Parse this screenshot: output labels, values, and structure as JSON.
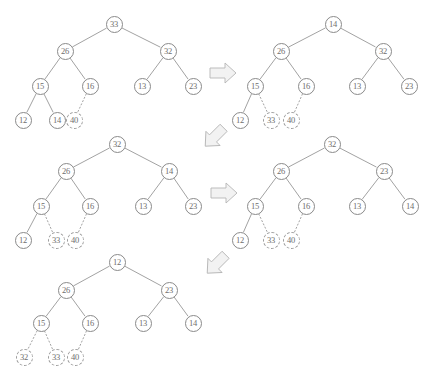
{
  "diagram": {
    "node_colors": {
      "stroke": "#8a8a8a",
      "dashed_stroke": "#9a9a9a",
      "text": "#6e6e6e",
      "edge": "#8a8a8a",
      "arrow_fill": "#f2f2f2",
      "arrow_stroke": "#b5b5b5"
    },
    "trees": [
      {
        "id": "tree-1",
        "nodes": [
          {
            "label": "33",
            "x": 114,
            "y": 24,
            "dashed": false
          },
          {
            "label": "26",
            "x": 65,
            "y": 51,
            "dashed": false
          },
          {
            "label": "32",
            "x": 168,
            "y": 51,
            "dashed": false
          },
          {
            "label": "15",
            "x": 40,
            "y": 86,
            "dashed": false
          },
          {
            "label": "16",
            "x": 90,
            "y": 86,
            "dashed": false
          },
          {
            "label": "13",
            "x": 142,
            "y": 86,
            "dashed": false
          },
          {
            "label": "23",
            "x": 193,
            "y": 86,
            "dashed": false
          },
          {
            "label": "12",
            "x": 23,
            "y": 120,
            "dashed": false
          },
          {
            "label": "14",
            "x": 57,
            "y": 120,
            "dashed": false
          },
          {
            "label": "40",
            "x": 74,
            "y": 120,
            "dashed": true
          }
        ],
        "edges": [
          {
            "from": 0,
            "to": 1,
            "dashed": false
          },
          {
            "from": 0,
            "to": 2,
            "dashed": false
          },
          {
            "from": 1,
            "to": 3,
            "dashed": false
          },
          {
            "from": 1,
            "to": 4,
            "dashed": false
          },
          {
            "from": 2,
            "to": 5,
            "dashed": false
          },
          {
            "from": 2,
            "to": 6,
            "dashed": false
          },
          {
            "from": 3,
            "to": 7,
            "dashed": false
          },
          {
            "from": 3,
            "to": 8,
            "dashed": false
          },
          {
            "from": 4,
            "to": 9,
            "dashed": true
          }
        ]
      },
      {
        "id": "tree-2",
        "nodes": [
          {
            "label": "14",
            "x": 333,
            "y": 24,
            "dashed": false
          },
          {
            "label": "26",
            "x": 281,
            "y": 51,
            "dashed": false
          },
          {
            "label": "32",
            "x": 383,
            "y": 51,
            "dashed": false
          },
          {
            "label": "15",
            "x": 255,
            "y": 86,
            "dashed": false
          },
          {
            "label": "16",
            "x": 306,
            "y": 86,
            "dashed": false
          },
          {
            "label": "13",
            "x": 357,
            "y": 86,
            "dashed": false
          },
          {
            "label": "23",
            "x": 409,
            "y": 86,
            "dashed": false
          },
          {
            "label": "12",
            "x": 240,
            "y": 120,
            "dashed": false
          },
          {
            "label": "33",
            "x": 271,
            "y": 120,
            "dashed": true
          },
          {
            "label": "40",
            "x": 291,
            "y": 120,
            "dashed": true
          }
        ],
        "edges": [
          {
            "from": 0,
            "to": 1,
            "dashed": false
          },
          {
            "from": 0,
            "to": 2,
            "dashed": false
          },
          {
            "from": 1,
            "to": 3,
            "dashed": false
          },
          {
            "from": 1,
            "to": 4,
            "dashed": false
          },
          {
            "from": 2,
            "to": 5,
            "dashed": false
          },
          {
            "from": 2,
            "to": 6,
            "dashed": false
          },
          {
            "from": 3,
            "to": 7,
            "dashed": false
          },
          {
            "from": 3,
            "to": 8,
            "dashed": true
          },
          {
            "from": 4,
            "to": 9,
            "dashed": true
          }
        ]
      },
      {
        "id": "tree-3",
        "nodes": [
          {
            "label": "32",
            "x": 117,
            "y": 144,
            "dashed": false
          },
          {
            "label": "26",
            "x": 66,
            "y": 171,
            "dashed": false
          },
          {
            "label": "14",
            "x": 169,
            "y": 171,
            "dashed": false
          },
          {
            "label": "15",
            "x": 41,
            "y": 206,
            "dashed": false
          },
          {
            "label": "16",
            "x": 90,
            "y": 206,
            "dashed": false
          },
          {
            "label": "13",
            "x": 143,
            "y": 206,
            "dashed": false
          },
          {
            "label": "23",
            "x": 193,
            "y": 206,
            "dashed": false
          },
          {
            "label": "12",
            "x": 23,
            "y": 240,
            "dashed": false
          },
          {
            "label": "33",
            "x": 56,
            "y": 240,
            "dashed": true
          },
          {
            "label": "40",
            "x": 75,
            "y": 240,
            "dashed": true
          }
        ],
        "edges": [
          {
            "from": 0,
            "to": 1,
            "dashed": false
          },
          {
            "from": 0,
            "to": 2,
            "dashed": false
          },
          {
            "from": 1,
            "to": 3,
            "dashed": false
          },
          {
            "from": 1,
            "to": 4,
            "dashed": false
          },
          {
            "from": 2,
            "to": 5,
            "dashed": false
          },
          {
            "from": 2,
            "to": 6,
            "dashed": false
          },
          {
            "from": 3,
            "to": 7,
            "dashed": false
          },
          {
            "from": 3,
            "to": 8,
            "dashed": true
          },
          {
            "from": 4,
            "to": 9,
            "dashed": true
          }
        ]
      },
      {
        "id": "tree-4",
        "nodes": [
          {
            "label": "32",
            "x": 332,
            "y": 144,
            "dashed": false
          },
          {
            "label": "26",
            "x": 281,
            "y": 171,
            "dashed": false
          },
          {
            "label": "23",
            "x": 384,
            "y": 171,
            "dashed": false
          },
          {
            "label": "15",
            "x": 255,
            "y": 206,
            "dashed": false
          },
          {
            "label": "16",
            "x": 306,
            "y": 206,
            "dashed": false
          },
          {
            "label": "13",
            "x": 357,
            "y": 206,
            "dashed": false
          },
          {
            "label": "14",
            "x": 410,
            "y": 206,
            "dashed": false
          },
          {
            "label": "12",
            "x": 240,
            "y": 240,
            "dashed": false
          },
          {
            "label": "33",
            "x": 271,
            "y": 240,
            "dashed": true
          },
          {
            "label": "40",
            "x": 291,
            "y": 240,
            "dashed": true
          }
        ],
        "edges": [
          {
            "from": 0,
            "to": 1,
            "dashed": false
          },
          {
            "from": 0,
            "to": 2,
            "dashed": false
          },
          {
            "from": 1,
            "to": 3,
            "dashed": false
          },
          {
            "from": 1,
            "to": 4,
            "dashed": false
          },
          {
            "from": 2,
            "to": 5,
            "dashed": false
          },
          {
            "from": 2,
            "to": 6,
            "dashed": false
          },
          {
            "from": 3,
            "to": 7,
            "dashed": false
          },
          {
            "from": 3,
            "to": 8,
            "dashed": true
          },
          {
            "from": 4,
            "to": 9,
            "dashed": true
          }
        ]
      },
      {
        "id": "tree-5",
        "nodes": [
          {
            "label": "12",
            "x": 117,
            "y": 262,
            "dashed": false
          },
          {
            "label": "26",
            "x": 66,
            "y": 290,
            "dashed": false
          },
          {
            "label": "23",
            "x": 169,
            "y": 290,
            "dashed": false
          },
          {
            "label": "15",
            "x": 41,
            "y": 323,
            "dashed": false
          },
          {
            "label": "16",
            "x": 90,
            "y": 323,
            "dashed": false
          },
          {
            "label": "13",
            "x": 143,
            "y": 323,
            "dashed": false
          },
          {
            "label": "14",
            "x": 193,
            "y": 323,
            "dashed": false
          },
          {
            "label": "32",
            "x": 24,
            "y": 357,
            "dashed": true
          },
          {
            "label": "33",
            "x": 56,
            "y": 357,
            "dashed": true
          },
          {
            "label": "40",
            "x": 75,
            "y": 357,
            "dashed": true
          }
        ],
        "edges": [
          {
            "from": 0,
            "to": 1,
            "dashed": false
          },
          {
            "from": 0,
            "to": 2,
            "dashed": false
          },
          {
            "from": 1,
            "to": 3,
            "dashed": false
          },
          {
            "from": 1,
            "to": 4,
            "dashed": false
          },
          {
            "from": 2,
            "to": 5,
            "dashed": false
          },
          {
            "from": 2,
            "to": 6,
            "dashed": false
          },
          {
            "from": 3,
            "to": 7,
            "dashed": true
          },
          {
            "from": 3,
            "to": 8,
            "dashed": true
          },
          {
            "from": 4,
            "to": 9,
            "dashed": true
          }
        ]
      }
    ],
    "arrows": [
      {
        "id": "arrow-1",
        "direction": "right",
        "x": 207,
        "y": 57
      },
      {
        "id": "arrow-2",
        "direction": "down-left",
        "x": 196,
        "y": 120
      },
      {
        "id": "arrow-3",
        "direction": "right",
        "x": 208,
        "y": 177
      },
      {
        "id": "arrow-4",
        "direction": "down-left",
        "x": 198,
        "y": 247
      }
    ]
  }
}
